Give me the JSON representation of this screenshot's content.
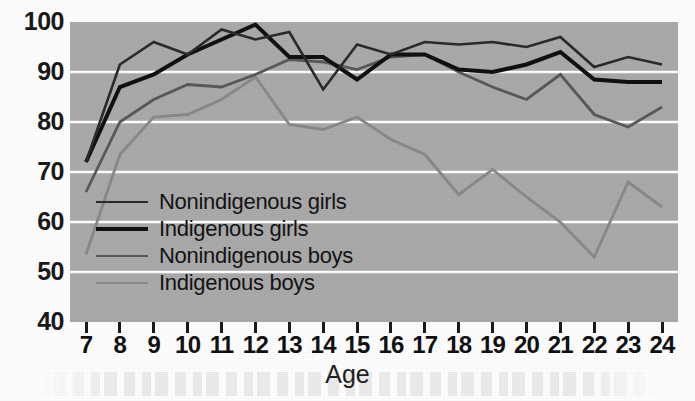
{
  "chart_data": {
    "type": "line",
    "title": "",
    "xlabel": "Age",
    "ylabel": "",
    "xlim": [
      7,
      24
    ],
    "ylim": [
      40,
      100
    ],
    "grid": true,
    "grid_axis": "y",
    "legend_position": "center-left-inside",
    "plot_background": "#ababab",
    "gridline_color": "#ffffff",
    "x": [
      7,
      8,
      9,
      10,
      11,
      12,
      13,
      14,
      15,
      16,
      17,
      18,
      19,
      20,
      21,
      22,
      23,
      24
    ],
    "xticklabels": [
      "7",
      "8",
      "9",
      "10",
      "11",
      "12",
      "13",
      "14",
      "15",
      "16",
      "17",
      "18",
      "19",
      "20",
      "21",
      "22",
      "23",
      "24"
    ],
    "yticklabels": [
      "40",
      "50",
      "60",
      "70",
      "80",
      "90",
      "100"
    ],
    "yticks": [
      40,
      50,
      60,
      70,
      80,
      90,
      100
    ],
    "series": [
      {
        "name": "Nonindigenous girls",
        "color": "#2b2b2b",
        "linewidth": 2.6,
        "values": [
          72.0,
          91.5,
          96.0,
          93.5,
          98.5,
          96.5,
          98.0,
          86.5,
          95.5,
          93.5,
          96.0,
          95.5,
          96.0,
          95.0,
          97.0,
          91.0,
          93.0,
          91.5
        ]
      },
      {
        "name": "Indigenous girls",
        "color": "#111111",
        "linewidth": 4.0,
        "values": [
          72.0,
          87.0,
          89.5,
          93.5,
          96.5,
          99.5,
          93.0,
          93.0,
          88.5,
          93.5,
          93.5,
          90.5,
          90.0,
          91.5,
          94.0,
          88.5,
          88.0,
          88.0
        ]
      },
      {
        "name": "Nonindigenous boys",
        "color": "#5a5a5a",
        "linewidth": 2.8,
        "values": [
          66.0,
          80.0,
          84.5,
          87.5,
          87.0,
          89.5,
          92.5,
          92.0,
          90.5,
          93.0,
          93.5,
          90.0,
          87.0,
          84.5,
          89.5,
          81.5,
          79.0,
          83.0
        ]
      },
      {
        "name": "Indigenous boys",
        "color": "#8a8a8a",
        "linewidth": 2.8,
        "values": [
          53.5,
          73.5,
          81.0,
          81.5,
          84.5,
          89.0,
          79.5,
          78.5,
          81.0,
          76.5,
          73.5,
          65.5,
          70.5,
          65.0,
          60.0,
          53.0,
          68.0,
          63.0
        ]
      }
    ]
  },
  "axis": {
    "x_title": "Age"
  },
  "legend": {
    "items": [
      {
        "label": "Nonindigenous girls"
      },
      {
        "label": "Indigenous girls"
      },
      {
        "label": "Nonindigenous boys"
      },
      {
        "label": "Indigenous boys"
      }
    ]
  }
}
